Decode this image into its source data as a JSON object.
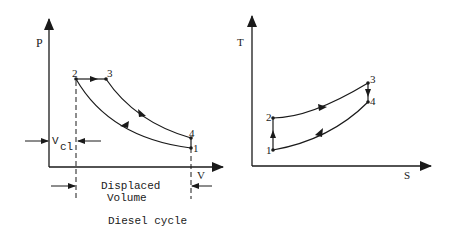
{
  "caption": "Diesel cycle",
  "pv_diagram": {
    "y_axis_label": "P",
    "x_axis_label": "V",
    "points": [
      {
        "id": "1",
        "label": "1"
      },
      {
        "id": "2",
        "label": "2"
      },
      {
        "id": "3",
        "label": "3"
      },
      {
        "id": "4",
        "label": "4"
      }
    ],
    "clearance_volume": {
      "main": "V",
      "sub": "cl"
    },
    "displaced_volume_line1": "Displaced",
    "displaced_volume_line2": "Volume"
  },
  "ts_diagram": {
    "y_axis_label": "T",
    "x_axis_label": "S",
    "points": [
      {
        "id": "1",
        "label": "1"
      },
      {
        "id": "2",
        "label": "2"
      },
      {
        "id": "3",
        "label": "3"
      },
      {
        "id": "4",
        "label": "4"
      }
    ]
  },
  "colors": {
    "line": "#1a1a1a",
    "background": "#ffffff"
  }
}
